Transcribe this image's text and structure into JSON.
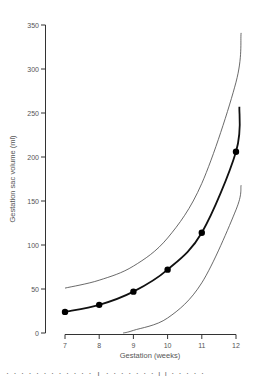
{
  "chart_data": {
    "type": "line",
    "title": "",
    "xlabel": "Gestation (weeks)",
    "ylabel": "Gestation sac volume (ml)",
    "xlim": [
      7,
      12
    ],
    "ylim": [
      0,
      350
    ],
    "x_ticks": [
      7,
      8,
      9,
      10,
      11,
      12
    ],
    "y_ticks": [
      0,
      50,
      100,
      150,
      200,
      250,
      300,
      350
    ],
    "grid": false,
    "legend": null,
    "series": [
      {
        "name": "Mean",
        "style": "thick line with markers",
        "x": [
          7,
          8,
          9,
          10,
          11,
          12
        ],
        "values": [
          24,
          32,
          47,
          72,
          114,
          206
        ],
        "line_end": {
          "x": 12.1,
          "y": 257
        }
      },
      {
        "name": "Upper limit",
        "style": "thin line",
        "x": [
          7,
          8,
          9,
          10,
          11,
          12,
          12.15
        ],
        "values": [
          51,
          60,
          76,
          108,
          170,
          285,
          341
        ]
      },
      {
        "name": "Lower limit",
        "style": "thin line",
        "x": [
          8.7,
          9,
          10,
          11,
          12,
          12.15
        ],
        "values": [
          0,
          3,
          17,
          57,
          140,
          168
        ]
      }
    ]
  },
  "axes": {
    "x_title": "Gestation (weeks)",
    "y_title": "Gestation sac volume (ml)",
    "x_tick_labels": [
      "7",
      "8",
      "9",
      "10",
      "11",
      "12"
    ],
    "y_tick_labels": [
      "0",
      "50",
      "100",
      "150",
      "200",
      "250",
      "300",
      "350"
    ]
  },
  "footer_cutoff_text": "· · · · ·  · · ·  ·  ·  ·  ·  T  ·  ·  ·  ·  ·  ·  ·  l l  ·  ·  ·  ·  ·"
}
